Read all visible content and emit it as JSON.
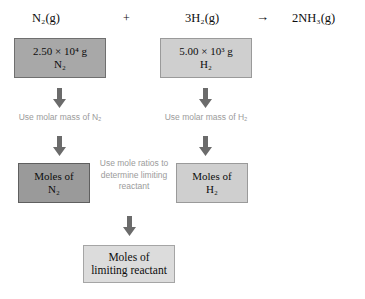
{
  "equation": {
    "reactant1": "N₂(g)",
    "plus": "+",
    "reactant2": "3H₂(g)",
    "arrow": "→",
    "product": "2NH₃(g)"
  },
  "flow": {
    "mass_n2": {
      "line1": "2.50 × 10⁴ g",
      "line2": "N₂"
    },
    "mass_h2": {
      "line1": "5.00 × 10³ g",
      "line2": "H₂"
    },
    "moles_n2": {
      "line1": "Moles of",
      "line2": "N₂"
    },
    "moles_h2": {
      "line1": "Moles of",
      "line2": "H₂"
    },
    "moles_limiting": {
      "line1": "Moles of",
      "line2": "limiting reactant"
    }
  },
  "annotations": {
    "left": "Use molar mass of N₂",
    "right": "Use molar mass of H₂",
    "middle": "Use mole ratios to determine limiting reactant"
  },
  "colors": {
    "box_mass_n2": "#a8a8a8",
    "box_mass_h2": "#cfcfcf",
    "box_moles_n2": "#9a9a9a",
    "box_moles_h2": "#cfcfcf",
    "box_moles_limiting": "#dcdcdc",
    "arrow_fill": "#6b6b6b",
    "annotation_text": "#9b9b9b",
    "background": "#ffffff"
  },
  "icons": {
    "down_arrow": "down-arrow-icon",
    "reaction_arrow": "right-arrow-icon"
  }
}
